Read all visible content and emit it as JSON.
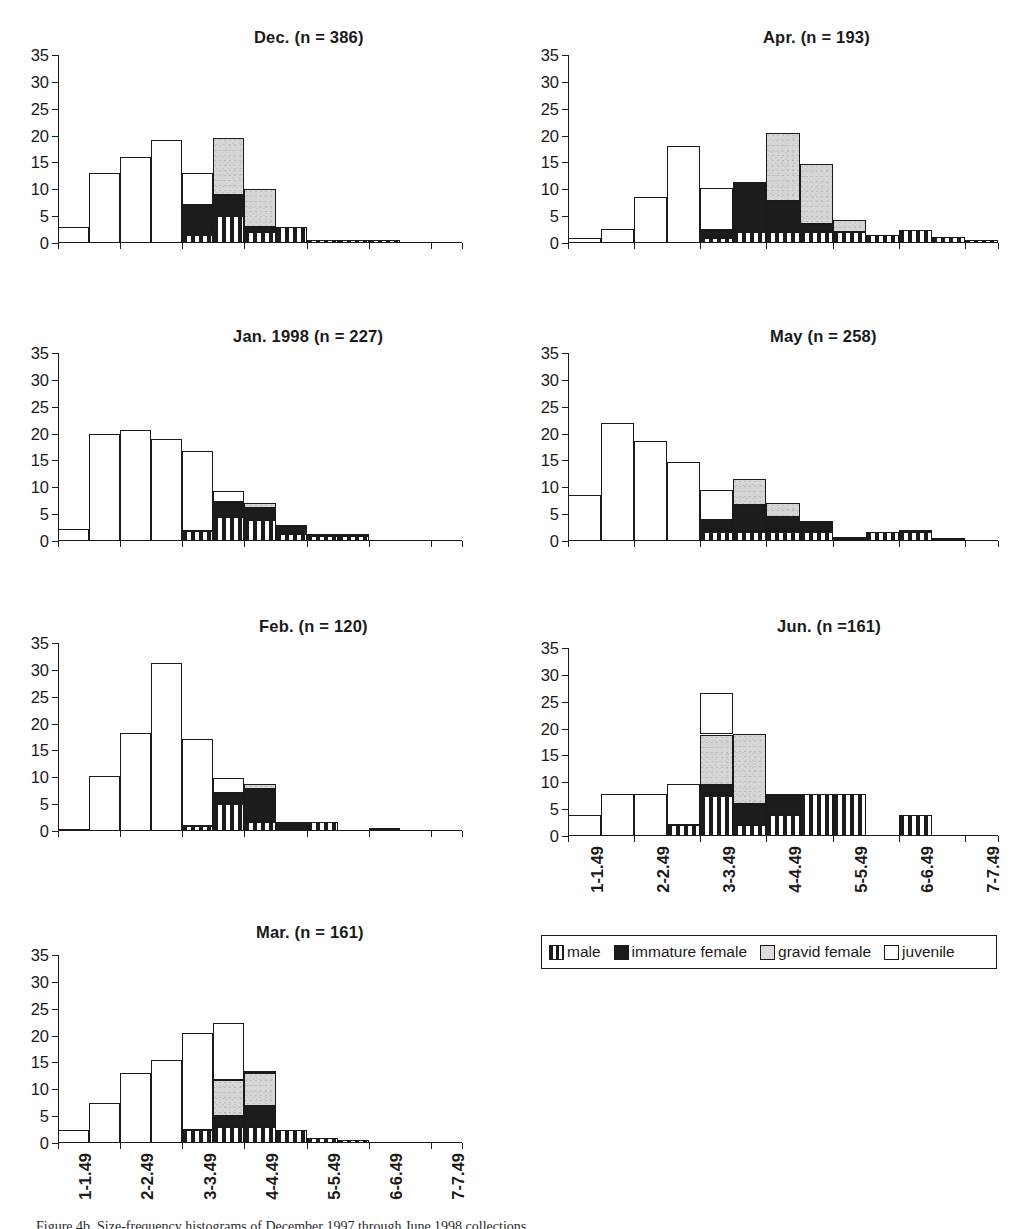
{
  "figure": {
    "caption": "Figure 4b. Size-frequency histograms of December 1997 through June 1998 collections.",
    "y_axis": {
      "min": 0,
      "max": 35,
      "ticks": [
        0,
        5,
        10,
        15,
        20,
        25,
        30,
        35
      ]
    },
    "x_axis": {
      "tick_labels": [
        "1-1.49",
        "2-2.49",
        "3-3.49",
        "4-4.49",
        "5-5.49",
        "6-6.49",
        "7-7.49"
      ]
    }
  },
  "legend": {
    "items": [
      {
        "key": "male",
        "label": "male",
        "swatch": "vertical-stripe-swatch",
        "color": "#1c1c1c"
      },
      {
        "key": "immature",
        "label": "immature female",
        "swatch": "black-swatch",
        "color": "#1c1c1c"
      },
      {
        "key": "gravid",
        "label": "gravid female",
        "swatch": "gray-swatch",
        "color": "#dcdcdc"
      },
      {
        "key": "juvenile",
        "label": "juvenile",
        "swatch": "white-swatch",
        "color": "#ffffff"
      }
    ]
  },
  "chart_data": [
    {
      "id": "dec",
      "type": "bar",
      "title": "Dec.  (n = 386)",
      "month": "Dec.",
      "n": 386,
      "ylabel": "",
      "xlabel": "",
      "ylim": [
        0,
        35
      ],
      "stacked": true,
      "series_order": [
        "male",
        "immature",
        "gravid",
        "juvenile"
      ],
      "categories": [
        "1-1.49",
        "1.5-1.99",
        "2-2.49",
        "2.5-2.99",
        "3-3.49",
        "3.5-3.99",
        "4-4.49",
        "4.5-4.99",
        "5-5.49",
        "5.5-5.99",
        "6-6.49",
        "6.5-6.99",
        "7-7.49"
      ],
      "series": [
        {
          "name": "male",
          "values": [
            0,
            0,
            0,
            0,
            1.5,
            5,
            2,
            3,
            0.6,
            0.6,
            0.6,
            0,
            0
          ]
        },
        {
          "name": "immature",
          "values": [
            0,
            0,
            0,
            0,
            5.5,
            4,
            1,
            0,
            0,
            0,
            0,
            0,
            0
          ]
        },
        {
          "name": "gravid",
          "values": [
            0,
            0,
            0,
            0,
            0,
            10.5,
            7,
            0,
            0,
            0,
            0,
            0,
            0
          ]
        },
        {
          "name": "juvenile",
          "values": [
            3,
            13,
            16,
            19.2,
            6,
            0,
            0,
            0,
            0,
            0,
            0,
            0,
            0
          ]
        }
      ],
      "totals": [
        3,
        13,
        16,
        19.2,
        13,
        19.5,
        10,
        3,
        0.6,
        0.6,
        0.6,
        0,
        0
      ]
    },
    {
      "id": "apr",
      "type": "bar",
      "title": "Apr.  (n = 193)",
      "month": "Apr.",
      "n": 193,
      "ylim": [
        0,
        35
      ],
      "stacked": true,
      "series_order": [
        "male",
        "immature",
        "gravid",
        "juvenile"
      ],
      "categories": [
        "1-1.49",
        "1.5-1.99",
        "2-2.49",
        "2.5-2.99",
        "3-3.49",
        "3.5-3.99",
        "4-4.49",
        "4.5-4.99",
        "5-5.49",
        "5.5-5.99",
        "6-6.49",
        "6.5-6.99",
        "7-7.49"
      ],
      "series": [
        {
          "name": "male",
          "values": [
            0,
            0,
            0,
            0,
            1,
            2,
            2,
            2,
            2,
            1.5,
            2.5,
            1.2,
            0.5
          ]
        },
        {
          "name": "immature",
          "values": [
            0,
            0,
            0,
            0,
            1.5,
            9.3,
            5.8,
            1.5,
            0,
            0,
            0,
            0,
            0
          ]
        },
        {
          "name": "gravid",
          "values": [
            0,
            0,
            0,
            0,
            0,
            0,
            12.7,
            11.2,
            2.3,
            0,
            0,
            0,
            0
          ]
        },
        {
          "name": "juvenile",
          "values": [
            1,
            2.7,
            8.6,
            18,
            7.8,
            0,
            0,
            0,
            0,
            0,
            0,
            0,
            0
          ]
        }
      ],
      "totals": [
        1,
        2.7,
        8.6,
        18,
        10.3,
        11.3,
        20.5,
        14.7,
        4.3,
        1.5,
        2.5,
        1.2,
        0.5
      ]
    },
    {
      "id": "jan",
      "type": "bar",
      "title": "Jan. 1998 (n = 227)",
      "month": "Jan. 1998",
      "n": 227,
      "ylim": [
        0,
        35
      ],
      "stacked": true,
      "series_order": [
        "male",
        "immature",
        "gravid",
        "juvenile"
      ],
      "categories": [
        "1-1.49",
        "1.5-1.99",
        "2-2.49",
        "2.5-2.99",
        "3-3.49",
        "3.5-3.99",
        "4-4.49",
        "4.5-4.99",
        "5-5.49",
        "5.5-5.99",
        "6-6.49",
        "6.5-6.99",
        "7-7.49"
      ],
      "series": [
        {
          "name": "male",
          "values": [
            0,
            0,
            0,
            0,
            1.8,
            4.4,
            4,
            1.3,
            0.9,
            0.9,
            0,
            0,
            0
          ]
        },
        {
          "name": "immature",
          "values": [
            0,
            0,
            0,
            0,
            0,
            2.8,
            2.2,
            1.7,
            0.4,
            0.1,
            0,
            0,
            0
          ]
        },
        {
          "name": "gravid",
          "values": [
            0,
            0,
            0,
            0,
            0,
            0,
            0.9,
            0,
            0,
            0,
            0,
            0,
            0
          ]
        },
        {
          "name": "juvenile",
          "values": [
            2.2,
            20,
            20.6,
            18.9,
            15,
            2.2,
            0,
            0,
            0,
            0,
            0,
            0,
            0
          ]
        }
      ],
      "totals": [
        2.2,
        20,
        20.6,
        18.9,
        16.8,
        9.4,
        7.1,
        3,
        1.3,
        1,
        0,
        0,
        0
      ]
    },
    {
      "id": "may",
      "type": "bar",
      "title": "May  (n = 258)",
      "month": "May",
      "n": 258,
      "ylim": [
        0,
        35
      ],
      "stacked": true,
      "series_order": [
        "male",
        "immature",
        "gravid",
        "juvenile"
      ],
      "categories": [
        "1-1.49",
        "1.5-1.99",
        "2-2.49",
        "2.5-2.99",
        "3-3.49",
        "3.5-3.99",
        "4-4.49",
        "4.5-4.99",
        "5-5.49",
        "5.5-5.99",
        "6-6.49",
        "6.5-6.99",
        "7-7.49"
      ],
      "series": [
        {
          "name": "male",
          "values": [
            0,
            0,
            0,
            0,
            1.6,
            1.6,
            1.6,
            1.6,
            0,
            1.6,
            1.6,
            0,
            0
          ]
        },
        {
          "name": "immature",
          "values": [
            0,
            0,
            0,
            0,
            2.3,
            5.1,
            2.8,
            2.1,
            0.8,
            0,
            0.5,
            0.5,
            0
          ]
        },
        {
          "name": "gravid",
          "values": [
            0,
            0,
            0,
            0,
            0,
            4.8,
            2.6,
            0,
            0,
            0,
            0,
            0,
            0
          ]
        },
        {
          "name": "juvenile",
          "values": [
            8.5,
            22,
            18.7,
            14.7,
            5.6,
            0,
            0,
            0,
            0,
            0,
            0,
            0,
            0
          ]
        }
      ],
      "totals": [
        8.5,
        22,
        18.7,
        14.7,
        9.5,
        11.5,
        7,
        3.7,
        0.8,
        1.6,
        2.1,
        0.5,
        0
      ]
    },
    {
      "id": "feb",
      "type": "bar",
      "title": "Feb.  (n = 120)",
      "month": "Feb.",
      "n": 120,
      "ylim": [
        0,
        35
      ],
      "stacked": true,
      "series_order": [
        "male",
        "immature",
        "gravid",
        "juvenile"
      ],
      "categories": [
        "1-1.49",
        "1.5-1.99",
        "2-2.49",
        "2.5-2.99",
        "3-3.49",
        "3.5-3.99",
        "4-4.49",
        "4.5-4.99",
        "5-5.49",
        "5.5-5.99",
        "6-6.49",
        "6.5-6.99",
        "7-7.49"
      ],
      "series": [
        {
          "name": "male",
          "values": [
            0,
            0,
            0,
            0,
            0.9,
            5,
            1.7,
            0,
            1.7,
            0,
            0,
            0,
            0
          ]
        },
        {
          "name": "immature",
          "values": [
            0,
            0,
            0,
            0,
            0,
            2,
            6.2,
            1.7,
            0,
            0,
            0.5,
            0,
            0
          ]
        },
        {
          "name": "gravid",
          "values": [
            0,
            0,
            0,
            0,
            0,
            0,
            0.9,
            0,
            0,
            0,
            0,
            0,
            0
          ]
        },
        {
          "name": "juvenile",
          "values": [
            0.4,
            10.2,
            18.3,
            31.2,
            16.2,
            2.8,
            0,
            0,
            0,
            0,
            0,
            0,
            0
          ]
        }
      ],
      "totals": [
        0.4,
        10.2,
        18.3,
        31.2,
        17.1,
        9.8,
        8.8,
        1.7,
        1.7,
        0,
        0.5,
        0,
        0
      ]
    },
    {
      "id": "jun",
      "type": "bar",
      "title": "Jun. (n =161)",
      "month": "Jun.",
      "n": 161,
      "ylim": [
        0,
        35
      ],
      "stacked": true,
      "series_order": [
        "male",
        "immature",
        "gravid",
        "juvenile"
      ],
      "categories": [
        "1-1.49",
        "1.5-1.99",
        "2-2.49",
        "2.5-2.99",
        "3-3.49",
        "3.5-3.99",
        "4-4.49",
        "4.5-4.99",
        "5-5.49",
        "5.5-5.99",
        "6-6.49",
        "6.5-6.99",
        "7-7.49"
      ],
      "series": [
        {
          "name": "male",
          "values": [
            0,
            0,
            0,
            2,
            7.5,
            2,
            4,
            7.8,
            7.8,
            0,
            4,
            0,
            0
          ]
        },
        {
          "name": "immature",
          "values": [
            0,
            0,
            0,
            0,
            2,
            4,
            3.8,
            0,
            0,
            0,
            0,
            0,
            0
          ]
        },
        {
          "name": "gravid",
          "values": [
            0,
            0,
            0,
            0,
            9.4,
            13,
            0,
            0,
            0,
            0,
            0,
            0,
            0
          ]
        },
        {
          "name": "juvenile",
          "values": [
            4,
            7.8,
            7.8,
            7.6,
            7.7,
            0,
            0,
            0,
            0,
            0,
            0,
            0,
            0
          ]
        }
      ],
      "totals": [
        4,
        7.8,
        7.8,
        9.6,
        26.6,
        19,
        7.8,
        7.8,
        7.8,
        0,
        4,
        0,
        0
      ]
    },
    {
      "id": "mar",
      "type": "bar",
      "title": "Mar. (n = 161)",
      "month": "Mar.",
      "n": 161,
      "ylim": [
        0,
        35
      ],
      "stacked": true,
      "series_order": [
        "male",
        "immature",
        "gravid",
        "juvenile"
      ],
      "categories": [
        "1-1.49",
        "1.5-1.99",
        "2-2.49",
        "2.5-2.99",
        "3-3.49",
        "3.5-3.99",
        "4-4.49",
        "4.5-4.99",
        "5-5.49",
        "5.5-5.99",
        "6-6.49",
        "6.5-6.99",
        "7-7.49"
      ],
      "series": [
        {
          "name": "male",
          "values": [
            0,
            0,
            0,
            0,
            2.5,
            3,
            3,
            2.4,
            1,
            0.5,
            0,
            0,
            0
          ]
        },
        {
          "name": "immature",
          "values": [
            0,
            0,
            0,
            0,
            0,
            2,
            3.8,
            0,
            0,
            0,
            0,
            0,
            0
          ]
        },
        {
          "name": "gravid",
          "values": [
            0,
            0,
            0,
            0,
            0,
            6.8,
            6.2,
            0,
            0,
            0,
            0,
            0,
            0
          ]
        },
        {
          "name": "juvenile",
          "values": [
            2.5,
            7.5,
            13,
            15.5,
            18,
            10.5,
            0.2,
            0,
            0,
            0,
            0,
            0,
            0
          ]
        }
      ],
      "totals": [
        2.5,
        7.5,
        13,
        15.5,
        20.5,
        12.3,
        13,
        2.4,
        1,
        0.5,
        0,
        0,
        0
      ]
    }
  ]
}
